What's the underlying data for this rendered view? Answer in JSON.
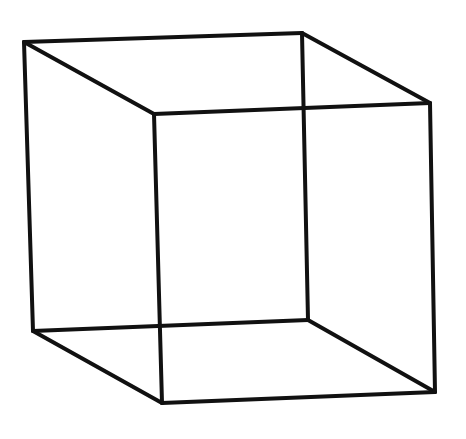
{
  "diagram": {
    "type": "wireframe-cube",
    "stroke_color": "#111111",
    "background": "#ffffff",
    "vertices": {
      "back_top_left": [
        24,
        42
      ],
      "back_top_right": [
        302,
        33
      ],
      "front_top_left": [
        154,
        114
      ],
      "front_top_right": [
        430,
        103
      ],
      "back_bottom_left": [
        33,
        331
      ],
      "back_bottom_right": [
        308,
        320
      ],
      "front_bottom_left": [
        162,
        403
      ],
      "front_bottom_right": [
        435,
        392
      ]
    },
    "edges": [
      [
        "back_top_left",
        "back_top_right"
      ],
      [
        "back_top_left",
        "front_top_left"
      ],
      [
        "back_top_right",
        "front_top_right"
      ],
      [
        "front_top_left",
        "front_top_right"
      ],
      [
        "back_bottom_left",
        "back_bottom_right"
      ],
      [
        "back_bottom_left",
        "front_bottom_left"
      ],
      [
        "back_bottom_right",
        "front_bottom_right"
      ],
      [
        "front_bottom_left",
        "front_bottom_right"
      ],
      [
        "back_top_left",
        "back_bottom_left"
      ],
      [
        "back_top_right",
        "back_bottom_right"
      ],
      [
        "front_top_left",
        "front_bottom_left"
      ],
      [
        "front_top_right",
        "front_bottom_right"
      ]
    ]
  }
}
